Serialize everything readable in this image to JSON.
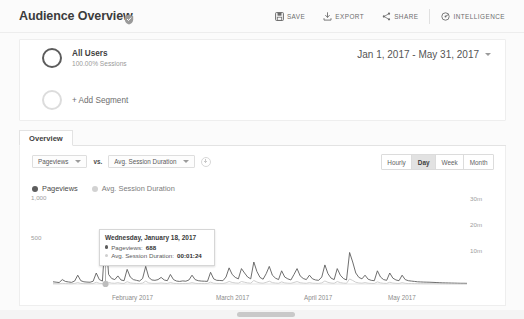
{
  "header": {
    "title": "Audience Overview",
    "shield_icon": "shield-icon",
    "actions": [
      {
        "label": "SAVE",
        "icon": "save-icon"
      },
      {
        "label": "EXPORT",
        "icon": "export-icon"
      },
      {
        "label": "SHARE",
        "icon": "share-icon"
      },
      {
        "label": "INTELLIGENCE",
        "icon": "intelligence-icon"
      }
    ]
  },
  "segments": {
    "all_users": {
      "name": "All Users",
      "sub": "100.00% Sessions"
    },
    "add_segment_label": "+ Add Segment",
    "date_range": "Jan 1, 2017 - May 31, 2017"
  },
  "tabs": [
    {
      "label": "Overview",
      "active": true
    }
  ],
  "controls": {
    "primary_metric": "Pageviews",
    "vs_label": "vs.",
    "secondary_metric": "Avg. Session Duration",
    "add_metric_icon": "plus-circle-icon",
    "granularity": [
      {
        "label": "Hourly",
        "active": false
      },
      {
        "label": "Day",
        "active": true
      },
      {
        "label": "Week",
        "active": false
      },
      {
        "label": "Month",
        "active": false
      }
    ]
  },
  "legend": [
    {
      "label": "Pageviews",
      "active": true
    },
    {
      "label": "Avg. Session Duration",
      "active": false
    }
  ],
  "tooltip": {
    "date": "Wednesday, January 18, 2017",
    "pageviews_label": "Pageviews:",
    "pageviews_value": "688",
    "duration_label": "Avg. Session Duration:",
    "duration_value": "00:01:24"
  },
  "colors": {
    "pageviews": "#5d5d5d",
    "duration": "#c9c9c9",
    "panel_bg": "#ffffff",
    "page_bg": "#fbfbfb",
    "active_button": "#e2e2e2"
  },
  "chart_data": {
    "type": "line",
    "title": "",
    "xlabel": "",
    "ylabel": "Pageviews",
    "y2label": "Avg. Session Duration",
    "grid": false,
    "legend_position": "top-left",
    "ylim": [
      0,
      1200
    ],
    "yticks": [
      500,
      1000
    ],
    "ytick_labels": [
      "500",
      "1,000"
    ],
    "y2lim": [
      0,
      2400
    ],
    "y2ticks": [
      600,
      1200,
      1800
    ],
    "y2tick_labels": [
      "10m",
      "20m",
      "30m"
    ],
    "xtick_labels": [
      "February 2017",
      "March 2017",
      "April 2017",
      "May 2017"
    ],
    "x_range": [
      "2017-01-01",
      "2017-05-31"
    ],
    "highlight": {
      "x_index": 17,
      "date": "Wednesday, January 18, 2017",
      "pageviews": 688,
      "avg_session_duration": "00:01:24"
    },
    "series": [
      {
        "name": "Pageviews",
        "color": "#5d5d5d",
        "values": [
          30,
          25,
          20,
          60,
          35,
          28,
          22,
          40,
          120,
          45,
          30,
          26,
          24,
          38,
          150,
          60,
          40,
          688,
          130,
          75,
          60,
          110,
          55,
          45,
          200,
          95,
          60,
          50,
          40,
          75,
          240,
          90,
          55,
          50,
          60,
          90,
          55,
          45,
          130,
          60,
          40,
          35,
          42,
          38,
          55,
          120,
          60,
          45,
          40,
          38,
          36,
          160,
          70,
          50,
          48,
          45,
          95,
          220,
          130,
          90,
          70,
          210,
          150,
          95,
          70,
          300,
          170,
          90,
          65,
          140,
          240,
          120,
          80,
          60,
          180,
          95,
          70,
          55,
          130,
          210,
          110,
          75,
          60,
          120,
          70,
          55,
          50,
          95,
          260,
          140,
          80,
          60,
          210,
          120,
          75,
          55,
          430,
          300,
          150,
          90,
          70,
          120,
          65,
          50,
          45,
          180,
          95,
          60,
          50,
          150,
          80,
          55,
          45,
          120,
          60,
          45,
          40,
          35,
          30,
          28,
          26,
          25,
          24,
          22,
          20,
          18,
          16,
          15,
          14,
          13,
          12,
          11,
          10,
          10,
          9
        ]
      },
      {
        "name": "Avg. Session Duration",
        "color": "#c9c9c9",
        "values": [
          10,
          8,
          6,
          18,
          12,
          9,
          7,
          14,
          40,
          15,
          10,
          8,
          8,
          12,
          48,
          20,
          13,
          84,
          42,
          24,
          20,
          36,
          18,
          14,
          64,
          30,
          20,
          16,
          13,
          24,
          78,
          29,
          18,
          16,
          19,
          29,
          18,
          14,
          42,
          19,
          13,
          11,
          14,
          12,
          18,
          38,
          19,
          14,
          13,
          12,
          12,
          52,
          22,
          16,
          15,
          14,
          30,
          70,
          42,
          29,
          22,
          68,
          48,
          30,
          22,
          96,
          54,
          29,
          21,
          45,
          77,
          38,
          26,
          19,
          58,
          30,
          22,
          18,
          42,
          67,
          35,
          24,
          19,
          38,
          22,
          18,
          16,
          30,
          83,
          45,
          26,
          19,
          67,
          38,
          24,
          18,
          138,
          96,
          48,
          29,
          22,
          38,
          21,
          16,
          14,
          58,
          30,
          19,
          16,
          48,
          26,
          18,
          14,
          38,
          19,
          14,
          13,
          11,
          10,
          9,
          8,
          8,
          8,
          7,
          6,
          6,
          5,
          5,
          4,
          4,
          4,
          3,
          3,
          3,
          3
        ]
      }
    ]
  },
  "scrollbar": {
    "orientation": "horizontal"
  }
}
